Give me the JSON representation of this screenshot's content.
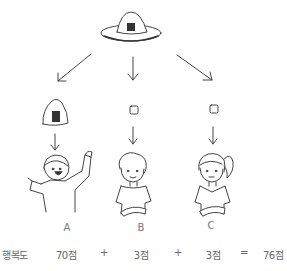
{
  "diagram": {
    "top_item": {
      "icon": "onigiri-on-plate-icon",
      "description": "Rice ball (onigiri) on a plate"
    },
    "branches": [
      {
        "arrow": "arrow-down-left",
        "item": {
          "icon": "onigiri-icon",
          "description": "Whole rice ball"
        },
        "person": {
          "label": "A",
          "expression": "very happy, arms raised"
        }
      },
      {
        "arrow": "arrow-down",
        "item": {
          "icon": "rice-grain-icon",
          "description": "Small piece"
        },
        "person": {
          "label": "B",
          "expression": "slightly smiling"
        }
      },
      {
        "arrow": "arrow-down-right",
        "item": {
          "icon": "rice-grain-icon",
          "description": "Small piece"
        },
        "person": {
          "label": "C",
          "expression": "neutral"
        }
      }
    ],
    "equation": {
      "term_label": "행복도",
      "values": [
        "70점",
        "3점",
        "3점"
      ],
      "operators": [
        "+",
        "+",
        "="
      ],
      "result": "76점"
    },
    "colors": {
      "stroke": "#444444",
      "fill_dark": "#333333",
      "text": "#666666"
    }
  }
}
